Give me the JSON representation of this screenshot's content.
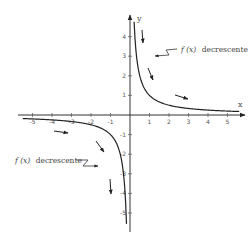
{
  "chart_data": {
    "type": "line",
    "title": "",
    "function": "f(x) = 1/x",
    "xlabel": "x",
    "ylabel": "y",
    "xlim": [
      -5.5,
      5.7
    ],
    "ylim": [
      -5.8,
      4.8
    ],
    "grid": false,
    "x_ticks": [
      -5,
      -4,
      -3,
      -2,
      -1,
      1,
      2,
      3,
      4,
      5
    ],
    "x_tick_labels": [
      "-5",
      "-4",
      "-3",
      "-2",
      "-1",
      "1",
      "2",
      "3",
      "4",
      "5"
    ],
    "y_ticks": [
      4,
      3,
      2,
      1,
      -1,
      -2,
      -3,
      -4,
      -5
    ],
    "y_tick_labels": [
      "4",
      "3",
      "2",
      "1",
      "-1",
      "-2",
      "-3",
      "-4",
      "-5"
    ],
    "series": [
      {
        "name": "f(x) branch x>0",
        "x": [
          0.21,
          0.25,
          0.3,
          0.4,
          0.5,
          0.7,
          1,
          1.5,
          2,
          3,
          4,
          5,
          5.6
        ],
        "y": [
          4.76,
          4,
          3.33,
          2.5,
          2,
          1.43,
          1,
          0.67,
          0.5,
          0.33,
          0.25,
          0.2,
          0.18
        ]
      },
      {
        "name": "f(x) branch x<0",
        "x": [
          -5.5,
          -5,
          -4,
          -3,
          -2,
          -1.5,
          -1,
          -0.7,
          -0.5,
          -0.4,
          -0.3,
          -0.25,
          -0.2,
          -0.18
        ],
        "y": [
          -0.18,
          -0.2,
          -0.25,
          -0.33,
          -0.5,
          -0.67,
          -1,
          -1.43,
          -2,
          -2.5,
          -3.33,
          -4,
          -5,
          -5.6
        ]
      }
    ],
    "annotations": [
      {
        "text_func": "f (x)",
        "text_word": "decrescente",
        "position": "upper-right"
      },
      {
        "text_func": "f (x)",
        "text_word": "decrescente",
        "position": "lower-left"
      }
    ],
    "direction_arrows": "arrows along each branch indicate the function is decreasing"
  },
  "labels": {
    "x_axis": "x",
    "y_axis": "y",
    "annot_upper_func": "f (x)",
    "annot_upper_word": "decrescente",
    "annot_lower_func": "f (x)",
    "annot_lower_word": "decrescente"
  },
  "ticks": {
    "x": [
      "-5",
      "-4",
      "-3",
      "-2",
      "-1",
      "1",
      "2",
      "3",
      "4",
      "5"
    ],
    "y": [
      "4",
      "3",
      "2",
      "1",
      "-1",
      "-2",
      "-3",
      "-4",
      "-5"
    ]
  }
}
